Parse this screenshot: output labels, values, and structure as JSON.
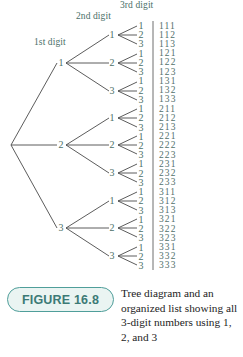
{
  "figure": {
    "badge_label": "FIGURE 16.8",
    "caption": "Tree diagram and an organized list showing all 3-digit numbers using 1, 2, and 3",
    "accent_color": "#4f9e9a",
    "badge_fill": "#eaf4f2",
    "label_color": "#4a6f68",
    "line_color": "#4a4a4a"
  },
  "headers": {
    "first": "1st digit",
    "second": "2nd digit",
    "third": "3rd digit"
  },
  "tree": {
    "root_children": [
      "1",
      "2",
      "3"
    ],
    "level1": [
      {
        "label": "1",
        "children": [
          "1",
          "2",
          "3"
        ]
      },
      {
        "label": "2",
        "children": [
          "1",
          "2",
          "3"
        ]
      },
      {
        "label": "3",
        "children": [
          "1",
          "2",
          "3"
        ]
      }
    ],
    "level2_digits": [
      "1",
      "2",
      "3"
    ]
  },
  "organized_list": {
    "title": "3-digit numbers using 1, 2, and 3",
    "count": 27,
    "numbers": [
      "111",
      "112",
      "113",
      "121",
      "122",
      "123",
      "131",
      "132",
      "133",
      "211",
      "212",
      "213",
      "221",
      "222",
      "223",
      "231",
      "232",
      "233",
      "311",
      "312",
      "313",
      "321",
      "322",
      "323",
      "331",
      "332",
      "333"
    ]
  }
}
